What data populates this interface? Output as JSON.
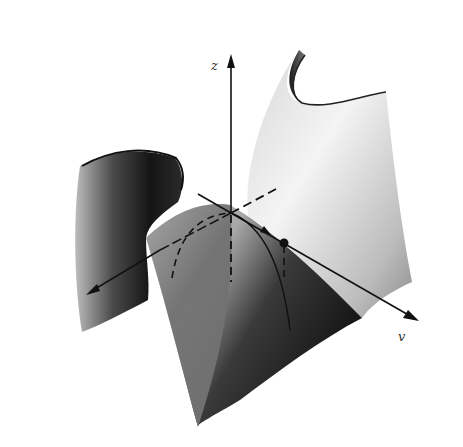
{
  "figure": {
    "axes": {
      "z": {
        "label": "z"
      },
      "v": {
        "label": "v"
      },
      "x": {
        "label": ""
      }
    },
    "colors": {
      "background": "#ffffff",
      "surface_light": "#f2f2f2",
      "surface_mid": "#9a9a9a",
      "surface_dark": "#1a1a1a",
      "axis": "#111111"
    }
  }
}
